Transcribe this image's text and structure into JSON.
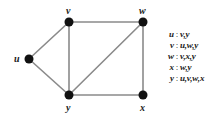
{
  "figure": {
    "background_color": "#ffffff",
    "node_color": "#111111",
    "edge_color": "#8a8a8a",
    "text_color": "#1a1a1a"
  },
  "graph": {
    "nodes": [
      {
        "id": "u",
        "label": "u",
        "cx": 29,
        "cy": 59,
        "r": 4.5,
        "label_x": 14,
        "label_y": 54
      },
      {
        "id": "v",
        "label": "v",
        "cx": 69,
        "cy": 22,
        "r": 4.5,
        "label_x": 66,
        "label_y": 6
      },
      {
        "id": "w",
        "label": "w",
        "cx": 143,
        "cy": 22,
        "r": 4.5,
        "label_x": 139,
        "label_y": 6
      },
      {
        "id": "y",
        "label": "y",
        "cx": 69,
        "cy": 95,
        "r": 4.5,
        "label_x": 66,
        "label_y": 103
      },
      {
        "id": "x",
        "label": "x",
        "cx": 143,
        "cy": 95,
        "r": 4.5,
        "label_x": 140,
        "label_y": 103
      }
    ],
    "edges": [
      {
        "id": "u-v",
        "from": "u",
        "to": "v",
        "x1": 29,
        "y1": 59,
        "x2": 69,
        "y2": 22
      },
      {
        "id": "u-y",
        "from": "u",
        "to": "y",
        "x1": 29,
        "y1": 59,
        "x2": 69,
        "y2": 95
      },
      {
        "id": "v-w",
        "from": "v",
        "to": "w",
        "x1": 69,
        "y1": 22,
        "x2": 143,
        "y2": 22
      },
      {
        "id": "v-y",
        "from": "v",
        "to": "y",
        "x1": 69,
        "y1": 22,
        "x2": 69,
        "y2": 95
      },
      {
        "id": "w-x",
        "from": "w",
        "to": "x",
        "x1": 143,
        "y1": 22,
        "x2": 143,
        "y2": 95
      },
      {
        "id": "w-y",
        "from": "w",
        "to": "y",
        "x1": 143,
        "y1": 22,
        "x2": 69,
        "y2": 95
      },
      {
        "id": "y-x",
        "from": "y",
        "to": "x",
        "x1": 69,
        "y1": 95,
        "x2": 143,
        "y2": 95
      }
    ]
  },
  "adjacency_list": {
    "separator": ":",
    "rows": [
      {
        "vertex": "u",
        "neighbors": "v,y"
      },
      {
        "vertex": "v",
        "neighbors": "u,w,y"
      },
      {
        "vertex": "w",
        "neighbors": "v,x,y"
      },
      {
        "vertex": "x",
        "neighbors": "w,y"
      },
      {
        "vertex": "y",
        "neighbors": "u,v,w,x"
      }
    ]
  }
}
